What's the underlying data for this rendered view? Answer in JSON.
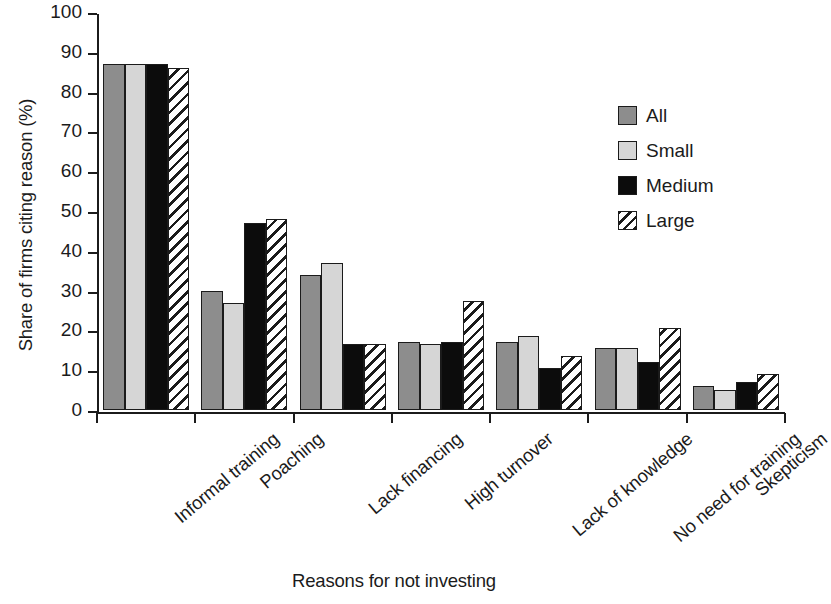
{
  "chart_data": {
    "type": "bar",
    "title": "",
    "xlabel": "Reasons for not investing",
    "ylabel": "Share of firms citing reason (%)",
    "ylim": [
      0,
      100
    ],
    "yticks": [
      0,
      10,
      20,
      30,
      40,
      50,
      60,
      70,
      80,
      90,
      100
    ],
    "ytick_labels": [
      "0",
      "10",
      "20",
      "30",
      "40",
      "50",
      "60",
      "70",
      "80",
      "90",
      "100"
    ],
    "grid": false,
    "legend_position": "upper right",
    "categories": [
      "Informal training",
      "Poaching",
      "Lack financing",
      "High turnover",
      "Lack of knowledge",
      "No need for training",
      "Skepticism"
    ],
    "series": [
      {
        "name": "All",
        "color": "#8d8d8d",
        "pattern": "solid",
        "values": [
          87,
          30,
          34,
          17,
          17,
          15.5,
          6
        ]
      },
      {
        "name": "Small",
        "color": "#d6d6d6",
        "pattern": "solid",
        "values": [
          87,
          27,
          37,
          16.5,
          18.5,
          15.5,
          5
        ]
      },
      {
        "name": "Medium",
        "color": "#0c0c0c",
        "pattern": "solid",
        "values": [
          87,
          47,
          16.5,
          17,
          10.5,
          12,
          7
        ]
      },
      {
        "name": "Large",
        "color": "#ffffff",
        "pattern": "diagonal-hatch",
        "values": [
          86,
          48,
          16.5,
          27.5,
          13.5,
          20.5,
          9
        ]
      }
    ]
  },
  "legend": {
    "items": [
      {
        "label": "All"
      },
      {
        "label": "Small"
      },
      {
        "label": "Medium"
      },
      {
        "label": "Large"
      }
    ]
  }
}
